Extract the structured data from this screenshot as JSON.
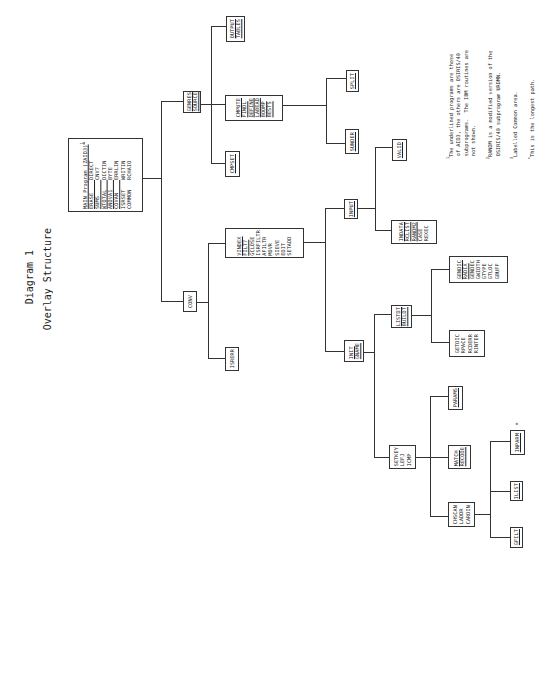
{
  "title": {
    "line1": "Diagram 1",
    "line2": "Overlay Structure"
  },
  "main_box": {
    "header": "MAIN Program (ZAID3)",
    "header_sup": "1",
    "col1": [
      "ERASE",
      "SUMS",
      "WTOTAL",
      "ANOVA1",
      "COVAN",
      "ISRSET",
      "COMMON"
    ],
    "col2": [
      "DIRECT",
      "CNV7",
      "DICTIN",
      "BYTE",
      "ERRLIN",
      "WRITIN",
      "RCHAIO"
    ]
  },
  "nodes": {
    "genres": [
      "GENRES",
      "SOURCE"
    ],
    "output": [
      "OUTPUT",
      "TABLES"
    ],
    "cmpute": [
      "CMPUTE",
      "FINDL",
      "DEFINE",
      "LABEAD",
      "BOOMP",
      "BESTS"
    ],
    "cmpset": [
      "CMPSET"
    ],
    "split": [
      "SPLIT"
    ],
    "sunder": [
      "SUNDER"
    ],
    "conv": [
      "CONV"
    ],
    "isrerr": [
      "ISRERR"
    ],
    "vindex": [
      "VINDEX",
      "FILT7",
      "GCLOSE",
      "ISRFILTR",
      "AFILTR",
      "MOVR",
      "SIEVE",
      "EDIT",
      "SETADD"
    ],
    "input": [
      "INPUT"
    ],
    "valid": [
      "VALID"
    ],
    "indata": [
      "INDATA",
      "RCLIST",
      "RANDM2",
      "CASE",
      "REXEC"
    ],
    "init": [
      "INIT",
      "GNAME"
    ],
    "listdt": [
      "LISTDT",
      "BUILDT"
    ],
    "gendic": [
      "GENDIC",
      "RADIX",
      "GENDEC",
      "GWIDTH",
      "GTYPE",
      "GTLOC",
      "GBUFF"
    ],
    "getdic": [
      "GETDIC",
      "RPACE",
      "RCDERR",
      "RINTER"
    ],
    "params": [
      "PARAMS"
    ],
    "setkey": [
      "SETKEY",
      "LEFJ",
      "ICMP"
    ],
    "match": [
      "MATCH",
      "RECODE"
    ],
    "chscan": [
      "CHSCAN",
      "LADDR",
      "CARDIN"
    ],
    "gfilt": [
      "GFILT"
    ],
    "ilist": [
      "ILIST"
    ],
    "inparm": [
      "INPARM"
    ],
    "inparm_mark": "*"
  },
  "notes": [
    {
      "sup": "1",
      "text": "The underlined programs are those\n of AID3, the others are OSIRIS/40\n subprograms.  The IBM routines are\n not shown."
    },
    {
      "sup": "2",
      "text": "RANDM is a modified version of the\n OSIRIS/40 subprogram URDMN."
    },
    {
      "sup": "3",
      "text": "Labelled Common area."
    },
    {
      "sup": "*",
      "text": "This is the longest path."
    }
  ]
}
